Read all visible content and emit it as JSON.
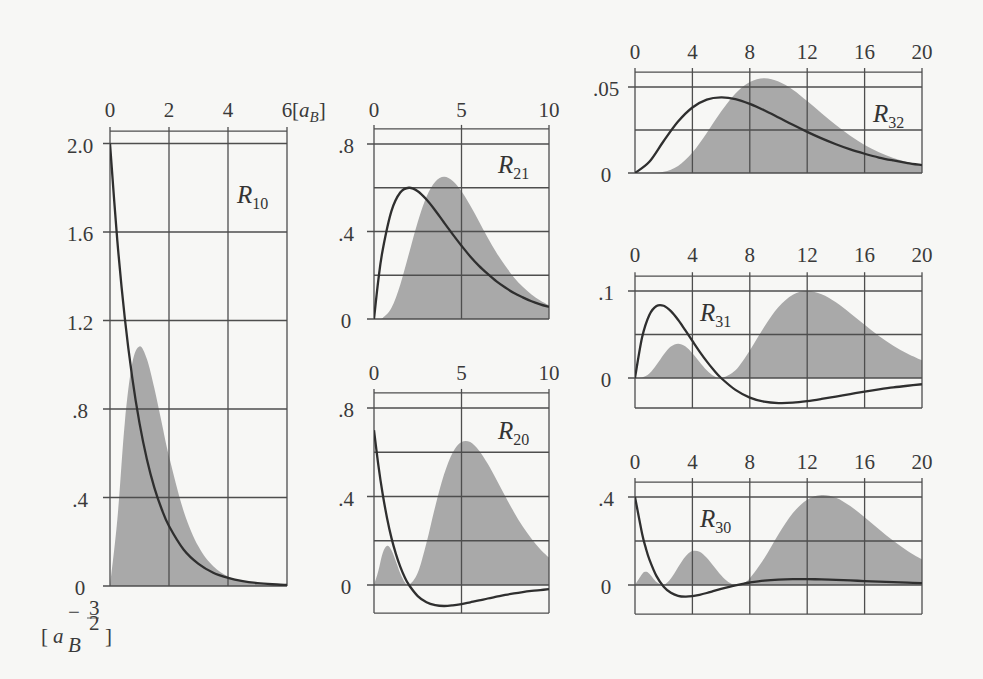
{
  "figure": {
    "x_unit": {
      "open": "[",
      "base": "a",
      "sub": "B",
      "close": "]"
    },
    "y_unit": {
      "open": "[",
      "base": "a",
      "sub": "B",
      "sup_sign": "−",
      "sup_num": "3",
      "sup_den": "2",
      "close": "]"
    }
  },
  "chart_data": {
    "type": "line",
    "title": "",
    "xlabel": "[a_B]",
    "ylabel": "[a_B^-3/2]",
    "legend": "none",
    "grid": true,
    "panels": [
      {
        "name": "R10",
        "label": {
          "main": "R",
          "sub": "10"
        },
        "xlim": [
          0,
          6
        ],
        "ylim": [
          0,
          2.056
        ],
        "x_ticks": [
          0,
          2,
          4,
          6
        ],
        "x_tick_labels": [
          "0",
          "2",
          "4",
          "6"
        ],
        "y_grid": [
          0,
          0.4,
          0.8,
          1.2,
          1.6,
          2.0
        ],
        "y_tick_labels": [
          {
            "v": 0,
            "t": "0"
          },
          {
            "v": 0.4,
            "t": ".4"
          },
          {
            "v": 0.8,
            "t": ".8"
          },
          {
            "v": 1.2,
            "t": "1.2"
          },
          {
            "v": 1.6,
            "t": "1.6"
          },
          {
            "v": 2.0,
            "t": "2.0"
          }
        ],
        "series": [
          {
            "name": "radial-function",
            "style": "line",
            "x": [
              0,
              0.25,
              0.5,
              0.75,
              1,
              1.25,
              1.5,
              1.75,
              2,
              2.5,
              3,
              3.5,
              4,
              4.5,
              5,
              5.5,
              6
            ],
            "y": [
              2.0,
              1.558,
              1.213,
              0.945,
              0.736,
              0.573,
              0.446,
              0.348,
              0.271,
              0.164,
              0.1,
              0.06,
              0.037,
              0.022,
              0.013,
              0.008,
              0.005
            ]
          },
          {
            "name": "probability-density",
            "style": "shaded",
            "x": [
              0,
              0.25,
              0.5,
              0.75,
              1,
              1.25,
              1.5,
              1.75,
              2,
              2.5,
              3,
              3.5,
              4,
              4.5,
              5,
              5.5,
              6
            ],
            "y": [
              0,
              0.303,
              0.736,
              1.004,
              1.083,
              1.026,
              0.896,
              0.74,
              0.586,
              0.337,
              0.178,
              0.089,
              0.043,
              0.02,
              0.009,
              0.004,
              0.002
            ]
          }
        ]
      },
      {
        "name": "R21",
        "label": {
          "main": "R",
          "sub": "21"
        },
        "xlim": [
          0,
          10
        ],
        "ylim": [
          0,
          0.869
        ],
        "x_ticks": [
          0,
          5,
          10
        ],
        "x_tick_labels": [
          "0",
          "5",
          "10"
        ],
        "y_grid": [
          0,
          0.2,
          0.4,
          0.6,
          0.8
        ],
        "y_tick_labels": [
          {
            "v": 0,
            "t": "0"
          },
          {
            "v": 0.4,
            "t": ".4"
          },
          {
            "v": 0.8,
            "t": ".8"
          }
        ],
        "series": [
          {
            "name": "radial-function",
            "style": "line",
            "x": [
              0,
              0.25,
              0.5,
              1,
              1.5,
              2,
              2.5,
              3,
              3.5,
              4,
              4.5,
              5,
              5.5,
              6,
              6.5,
              7,
              7.5,
              8,
              8.5,
              9,
              9.5,
              10
            ],
            "y": [
              0,
              0.18,
              0.317,
              0.494,
              0.578,
              0.6,
              0.584,
              0.546,
              0.496,
              0.441,
              0.387,
              0.335,
              0.286,
              0.243,
              0.206,
              0.172,
              0.144,
              0.119,
              0.099,
              0.081,
              0.067,
              0.055
            ]
          },
          {
            "name": "probability-density",
            "style": "shaded",
            "x": [
              0,
              0.25,
              0.5,
              1,
              1.5,
              2,
              2.5,
              3,
              3.5,
              4,
              4.5,
              5,
              5.5,
              6,
              6.5,
              7,
              7.5,
              8,
              8.5,
              9,
              9.5,
              10
            ],
            "y": [
              0,
              0.0,
              0.005,
              0.051,
              0.157,
              0.3,
              0.444,
              0.559,
              0.628,
              0.65,
              0.631,
              0.584,
              0.519,
              0.446,
              0.372,
              0.303,
              0.243,
              0.19,
              0.147,
              0.112,
              0.085,
              0.063
            ]
          }
        ]
      },
      {
        "name": "R20",
        "label": {
          "main": "R",
          "sub": "20"
        },
        "xlim": [
          0,
          10
        ],
        "ylim": [
          -0.127,
          0.868
        ],
        "x_ticks": [
          0,
          5,
          10
        ],
        "x_tick_labels": [
          "0",
          "5",
          "10"
        ],
        "y_grid": [
          0,
          0.2,
          0.4,
          0.6,
          0.8
        ],
        "y_tick_labels": [
          {
            "v": 0,
            "t": "0"
          },
          {
            "v": 0.4,
            "t": ".4"
          },
          {
            "v": 0.8,
            "t": ".8"
          }
        ],
        "series": [
          {
            "name": "radial-function",
            "style": "line",
            "x": [
              0,
              0.25,
              0.5,
              0.75,
              1,
              1.25,
              1.5,
              1.75,
              2,
              2.5,
              3,
              3.5,
              4,
              4.5,
              5,
              5.5,
              6,
              6.5,
              7,
              7.5,
              8,
              8.5,
              9,
              9.5,
              10
            ],
            "y": [
              0.7,
              0.541,
              0.409,
              0.301,
              0.212,
              0.141,
              0.083,
              0.036,
              0,
              -0.05,
              -0.078,
              -0.091,
              -0.095,
              -0.092,
              -0.086,
              -0.078,
              -0.07,
              -0.061,
              -0.053,
              -0.045,
              -0.038,
              -0.032,
              -0.027,
              -0.023,
              -0.019
            ]
          },
          {
            "name": "probability-density",
            "style": "shaded",
            "x": [
              0,
              0.25,
              0.5,
              0.75,
              1,
              1.25,
              1.5,
              1.75,
              2,
              2.5,
              3,
              3.5,
              4,
              4.5,
              5,
              5.5,
              6,
              6.5,
              7,
              7.5,
              8,
              8.5,
              9,
              9.5,
              10
            ],
            "y": [
              0,
              0.064,
              0.145,
              0.177,
              0.157,
              0.107,
              0.053,
              0.014,
              0,
              0.055,
              0.191,
              0.355,
              0.499,
              0.599,
              0.646,
              0.646,
              0.608,
              0.548,
              0.476,
              0.401,
              0.329,
              0.264,
              0.209,
              0.162,
              0.124
            ]
          }
        ]
      },
      {
        "name": "R32",
        "label": {
          "main": "R",
          "sub": "32"
        },
        "xlim": [
          0,
          20
        ],
        "ylim": [
          0,
          0.0587
        ],
        "x_ticks": [
          0,
          4,
          8,
          12,
          16,
          20
        ],
        "x_tick_labels": [
          "0",
          "4",
          "8",
          "12",
          "16",
          "20"
        ],
        "y_grid": [
          0,
          0.025,
          0.05
        ],
        "y_tick_labels": [
          {
            "v": 0,
            "t": "0"
          },
          {
            "v": 0.05,
            "t": ".05"
          }
        ],
        "series": [
          {
            "name": "radial-function",
            "style": "line",
            "x": [
              0,
              1,
              2,
              3,
              4,
              5,
              6,
              7,
              8,
              9,
              10,
              11,
              12,
              13,
              14,
              15,
              16,
              17,
              18,
              19,
              20
            ],
            "y": [
              0,
              0.0065,
              0.0186,
              0.0299,
              0.0381,
              0.0427,
              0.044,
              0.043,
              0.0402,
              0.0365,
              0.0323,
              0.028,
              0.0239,
              0.0201,
              0.0167,
              0.0137,
              0.0112,
              0.009,
              0.0073,
              0.0058,
              0.0046
            ]
          },
          {
            "name": "probability-density",
            "style": "shaded",
            "x": [
              0,
              1,
              2,
              3,
              4,
              5,
              6,
              7,
              8,
              9,
              10,
              11,
              12,
              13,
              14,
              15,
              16,
              17,
              18,
              19,
              20
            ],
            "y": [
              0,
              0.0,
              0.0007,
              0.0041,
              0.0119,
              0.0233,
              0.0357,
              0.0462,
              0.0529,
              0.0551,
              0.0532,
              0.0484,
              0.0418,
              0.0347,
              0.0279,
              0.0216,
              0.0163,
              0.0121,
              0.0087,
              0.0062,
              0.0043
            ]
          }
        ]
      },
      {
        "name": "R31",
        "label": {
          "main": "R",
          "sub": "31"
        },
        "xlim": [
          0,
          20
        ],
        "ylim": [
          -0.0345,
          0.117
        ],
        "x_ticks": [
          0,
          4,
          8,
          12,
          16,
          20
        ],
        "x_tick_labels": [
          "0",
          "4",
          "8",
          "12",
          "16",
          "20"
        ],
        "y_grid": [
          0,
          0.05,
          0.1
        ],
        "y_tick_labels": [
          {
            "v": 0,
            "t": "0"
          },
          {
            "v": 0.1,
            "t": ".1"
          }
        ],
        "series": [
          {
            "name": "radial-function",
            "style": "line",
            "x": [
              0,
              0.5,
              1,
              1.5,
              2,
              2.5,
              3,
              3.5,
              4,
              4.5,
              5,
              5.5,
              6,
              7,
              8,
              9,
              10,
              11,
              12,
              13,
              14,
              15,
              16,
              17,
              18,
              19,
              20
            ],
            "y": [
              0,
              0.047,
              0.0724,
              0.0827,
              0.083,
              0.0768,
              0.0669,
              0.055,
              0.0426,
              0.0304,
              0.0191,
              0.0089,
              0,
              -0.0137,
              -0.0225,
              -0.0272,
              -0.0288,
              -0.0284,
              -0.0266,
              -0.0241,
              -0.0213,
              -0.0184,
              -0.0156,
              -0.0131,
              -0.0108,
              -0.0089,
              -0.0072
            ]
          },
          {
            "name": "probability-density",
            "style": "shaded",
            "x": [
              0,
              0.5,
              1,
              1.5,
              2,
              2.5,
              3,
              3.5,
              4,
              4.5,
              5,
              5.5,
              6,
              7,
              8,
              9,
              10,
              11,
              12,
              13,
              14,
              15,
              16,
              17,
              18,
              19,
              20
            ],
            "y": [
              0,
              0.0005,
              0.0051,
              0.0151,
              0.027,
              0.0362,
              0.0395,
              0.0364,
              0.0285,
              0.0184,
              0.0089,
              0.0023,
              0,
              0.009,
              0.0317,
              0.0586,
              0.0815,
              0.0958,
              0.1,
              0.0963,
              0.087,
              0.0745,
              0.0611,
              0.0484,
              0.0371,
              0.0278,
              0.0203
            ]
          }
        ]
      },
      {
        "name": "R30",
        "label": {
          "main": "R",
          "sub": "30"
        },
        "xlim": [
          0,
          20
        ],
        "ylim": [
          -0.132,
          0.468
        ],
        "x_ticks": [
          0,
          4,
          8,
          12,
          16,
          20
        ],
        "x_tick_labels": [
          "0",
          "4",
          "8",
          "12",
          "16",
          "20"
        ],
        "y_grid": [
          0,
          0.2,
          0.4
        ],
        "y_tick_labels": [
          {
            "v": 0,
            "t": "0"
          },
          {
            "v": 0.4,
            "t": ".4"
          }
        ],
        "series": [
          {
            "name": "radial-function",
            "style": "line",
            "x": [
              0,
              0.5,
              0.75,
              1,
              1.5,
              2,
              2.5,
              3,
              3.5,
              4,
              4.5,
              5,
              5.5,
              6,
              6.5,
              7,
              7.5,
              8,
              9,
              10,
              11,
              12,
              13,
              14,
              15,
              16,
              17,
              18,
              19,
              20
            ],
            "y": [
              0.4,
              0.2319,
              0.1687,
              0.1167,
              0.0404,
              -0.0076,
              -0.0354,
              -0.049,
              -0.053,
              -0.0508,
              -0.0446,
              -0.0364,
              -0.0272,
              -0.018,
              -0.0093,
              -0.0014,
              0.0055,
              0.0113,
              0.0199,
              0.0248,
              0.0269,
              0.0268,
              0.0254,
              0.0232,
              0.0207,
              0.018,
              0.0153,
              0.0129,
              0.0107,
              0.0088
            ]
          },
          {
            "name": "probability-density",
            "style": "shaded",
            "x": [
              0,
              0.5,
              0.75,
              1,
              1.5,
              2,
              2.5,
              3,
              3.5,
              4,
              4.5,
              5,
              5.5,
              6,
              6.5,
              7,
              7.5,
              8,
              9,
              10,
              11,
              12,
              13,
              14,
              15,
              16,
              17,
              18,
              19,
              20
            ],
            "y": [
              0,
              0.0503,
              0.0598,
              0.0509,
              0.0137,
              0.0009,
              0.0293,
              0.0809,
              0.1289,
              0.1541,
              0.1507,
              0.1237,
              0.084,
              0.0438,
              0.0138,
              0.0,
              0.0063,
              0.0307,
              0.1201,
              0.2306,
              0.3271,
              0.3877,
              0.409,
              0.3967,
              0.3589,
              0.3082,
              0.2536,
              0.201,
              0.1545,
              0.1159
            ]
          }
        ]
      }
    ]
  }
}
